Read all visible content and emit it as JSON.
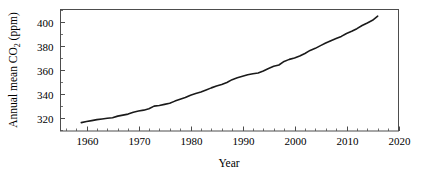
{
  "chart_data": {
    "type": "line",
    "title": "",
    "subtitle": "",
    "xlabel": "Year",
    "ylabel_parts": {
      "pre": "Annual mean CO",
      "sub": "2",
      "post": " (ppm)"
    },
    "ylabel": "Annual mean CO2 (ppm)",
    "xlim": [
      1955,
      2020
    ],
    "ylim": [
      309,
      410
    ],
    "grid": false,
    "legend": null,
    "xticks": [
      1960,
      1970,
      1980,
      1990,
      2000,
      2010,
      2020
    ],
    "xtick_labels": [
      "1960",
      "1970",
      "1980",
      "1990",
      "2000",
      "2010",
      "2020"
    ],
    "minor_xtick_step": 2,
    "yticks": [
      320,
      340,
      360,
      380,
      400
    ],
    "ytick_labels": [
      "320",
      "340",
      "360",
      "380",
      "400"
    ],
    "minor_ytick_step": 10,
    "line_color": "#1a1a1a",
    "line_width": 1.6,
    "axis_color": "#4d4d4d",
    "background": "#ffffff",
    "series": [
      {
        "name": "Annual mean CO2",
        "x": [
          1959,
          1960,
          1961,
          1962,
          1963,
          1964,
          1965,
          1966,
          1967,
          1968,
          1969,
          1970,
          1971,
          1972,
          1973,
          1974,
          1975,
          1976,
          1977,
          1978,
          1979,
          1980,
          1981,
          1982,
          1983,
          1984,
          1985,
          1986,
          1987,
          1988,
          1989,
          1990,
          1991,
          1992,
          1993,
          1994,
          1995,
          1996,
          1997,
          1998,
          1999,
          2000,
          2001,
          2002,
          2003,
          2004,
          2005,
          2006,
          2007,
          2008,
          2009,
          2010,
          2011,
          2012,
          2013,
          2014,
          2015,
          2016
        ],
        "values": [
          315.98,
          316.91,
          317.64,
          318.45,
          318.99,
          319.62,
          320.04,
          321.37,
          322.18,
          323.05,
          324.62,
          325.68,
          326.32,
          327.46,
          329.68,
          330.19,
          331.12,
          332.03,
          333.84,
          335.41,
          336.84,
          338.76,
          340.12,
          341.48,
          343.15,
          344.85,
          346.35,
          347.61,
          349.31,
          351.69,
          353.2,
          354.45,
          355.7,
          356.54,
          357.21,
          358.96,
          360.97,
          362.74,
          363.88,
          366.84,
          368.54,
          369.71,
          371.32,
          373.45,
          375.98,
          377.7,
          379.98,
          382.09,
          384.02,
          385.83,
          387.64,
          390.1,
          391.85,
          394.06,
          396.74,
          398.81,
          401.01,
          404.41
        ],
        "units": "ppm"
      }
    ]
  },
  "axis": {
    "x_title": "Year",
    "y_title_pre": "Annual mean CO",
    "y_title_sub": "2",
    "y_title_post": " (ppm)"
  }
}
